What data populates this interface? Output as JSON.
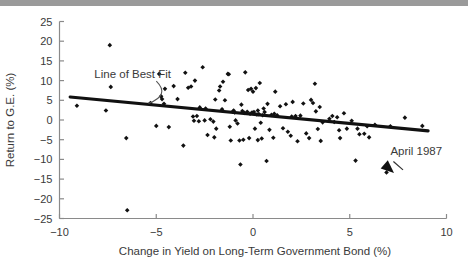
{
  "figure": {
    "top_band_color": "#9a9a9a",
    "background_color": "#ffffff",
    "axis_color": "#8a8a8a",
    "marker_color": "#111111",
    "fit_line_color": "#111111"
  },
  "chart_data": {
    "type": "scatter",
    "title": "",
    "xlabel": "Change in Yield on Long-Term Government Bond (%)",
    "ylabel": "Return to G.E. (%)",
    "xlim": [
      -10,
      10
    ],
    "ylim": [
      -25,
      25
    ],
    "xticks": [
      -10,
      -5,
      0,
      5,
      10
    ],
    "xticklabels": [
      "−10",
      "−5",
      "0",
      "5",
      "10"
    ],
    "yticks": [
      -25,
      -20,
      -15,
      -10,
      -5,
      0,
      5,
      10,
      15,
      20,
      25
    ],
    "yticklabels": [
      "−25",
      "−20",
      "−15",
      "−10",
      "−5",
      "0",
      "5",
      "10",
      "15",
      "20",
      "25"
    ],
    "grid": false,
    "legend": "none",
    "annotations": [
      {
        "name": "line-of-best-fit",
        "text": "Line of Best Fit",
        "text_x": -8.2,
        "text_y": 10.6,
        "points_to_x": -5.4,
        "points_to_y": 4.2
      },
      {
        "name": "april-1987",
        "text": "April 1987",
        "text_x": 7.1,
        "text_y": -9.0,
        "points_to_x": 6.9,
        "points_to_y": -13.3
      }
    ],
    "fit_line": {
      "label": "Line of Best Fit",
      "x": [
        -9.45,
        9.05
      ],
      "y": [
        5.85,
        -2.75
      ],
      "slope": -0.465,
      "intercept": 1.45
    },
    "series": [
      {
        "name": "G.E. monthly returns",
        "marker": "diamond",
        "points": [
          [
            -9.1,
            3.6
          ],
          [
            -7.4,
            19.0
          ],
          [
            -7.35,
            8.4
          ],
          [
            -7.6,
            2.4
          ],
          [
            -6.55,
            -4.6
          ],
          [
            -6.5,
            -22.9
          ],
          [
            -5.0,
            -1.5
          ],
          [
            -4.85,
            11.7
          ],
          [
            -4.75,
            6.0
          ],
          [
            -4.7,
            5.3
          ],
          [
            -4.6,
            4.1
          ],
          [
            -4.55,
            7.9
          ],
          [
            -4.35,
            -1.8
          ],
          [
            -4.1,
            8.6
          ],
          [
            -3.9,
            5.3
          ],
          [
            -3.6,
            -6.5
          ],
          [
            -3.5,
            12.0
          ],
          [
            -3.35,
            8.2
          ],
          [
            -3.2,
            8.5
          ],
          [
            -3.1,
            0.9
          ],
          [
            -3.05,
            -0.2
          ],
          [
            -3.0,
            10.0
          ],
          [
            -2.8,
            -0.3
          ],
          [
            -2.75,
            3.2
          ],
          [
            -2.6,
            13.4
          ],
          [
            -2.5,
            -0.1
          ],
          [
            -2.45,
            2.9
          ],
          [
            -2.35,
            -3.8
          ],
          [
            -2.2,
            0.2
          ],
          [
            -2.05,
            -0.4
          ],
          [
            -2.0,
            -4.4
          ],
          [
            -1.95,
            5.2
          ],
          [
            -1.9,
            -2.2
          ],
          [
            -1.75,
            7.5
          ],
          [
            -1.7,
            8.5
          ],
          [
            -1.6,
            2.7
          ],
          [
            -1.55,
            9.7
          ],
          [
            -1.45,
            5.0
          ],
          [
            -1.3,
            11.7
          ],
          [
            -1.25,
            11.6
          ],
          [
            -1.2,
            -1.7
          ],
          [
            -1.15,
            -5.2
          ],
          [
            -1.05,
            2.1
          ],
          [
            -0.95,
            1.9
          ],
          [
            -0.9,
            -0.1
          ],
          [
            -0.8,
            -0.9
          ],
          [
            -0.7,
            -5.2
          ],
          [
            -0.65,
            -11.3
          ],
          [
            -0.6,
            3.9
          ],
          [
            -0.5,
            -5.0
          ],
          [
            -0.45,
            1.8
          ],
          [
            -0.4,
            12.1
          ],
          [
            -0.3,
            2.1
          ],
          [
            -0.25,
            7.6
          ],
          [
            -0.2,
            -4.6
          ],
          [
            -0.15,
            1.6
          ],
          [
            -0.1,
            7.9
          ],
          [
            -0.05,
            1.9
          ],
          [
            0.0,
            7.2
          ],
          [
            0.05,
            2.0
          ],
          [
            0.1,
            -2.2
          ],
          [
            0.15,
            8.1
          ],
          [
            0.2,
            1.4
          ],
          [
            0.25,
            -5.1
          ],
          [
            0.3,
            1.5
          ],
          [
            0.35,
            9.4
          ],
          [
            0.4,
            -0.7
          ],
          [
            0.45,
            -4.7
          ],
          [
            0.5,
            1.2
          ],
          [
            0.55,
            2.9
          ],
          [
            0.7,
            -10.4
          ],
          [
            0.75,
            4.1
          ],
          [
            0.85,
            -2.5
          ],
          [
            0.95,
            1.3
          ],
          [
            1.05,
            -4.5
          ],
          [
            1.15,
            7.2
          ],
          [
            1.25,
            1.2
          ],
          [
            1.4,
            3.5
          ],
          [
            1.55,
            -2.1
          ],
          [
            1.7,
            4.0
          ],
          [
            1.8,
            -3.0
          ],
          [
            1.95,
            -4.0
          ],
          [
            2.05,
            4.6
          ],
          [
            2.2,
            1.0
          ],
          [
            2.3,
            -5.4
          ],
          [
            2.45,
            1.1
          ],
          [
            2.6,
            4.2
          ],
          [
            2.75,
            -3.4
          ],
          [
            2.9,
            -4.6
          ],
          [
            3.0,
            5.1
          ],
          [
            3.1,
            4.3
          ],
          [
            3.2,
            9.2
          ],
          [
            3.25,
            2.2
          ],
          [
            3.35,
            -2.3
          ],
          [
            3.45,
            3.3
          ],
          [
            3.5,
            -5.3
          ],
          [
            3.6,
            -0.6
          ],
          [
            3.95,
            0.3
          ],
          [
            4.1,
            1.0
          ],
          [
            4.2,
            -0.5
          ],
          [
            4.35,
            0.7
          ],
          [
            4.45,
            -2.6
          ],
          [
            4.5,
            -4.6
          ],
          [
            4.7,
            1.7
          ],
          [
            4.85,
            -2.2
          ],
          [
            5.1,
            -0.2
          ],
          [
            5.3,
            -10.3
          ],
          [
            5.4,
            -2.2
          ],
          [
            5.5,
            -3.6
          ],
          [
            5.75,
            -3.5
          ],
          [
            5.9,
            -1.6
          ],
          [
            6.0,
            -4.4
          ],
          [
            6.3,
            -1.2
          ],
          [
            6.9,
            -13.3
          ],
          [
            7.1,
            -1.6
          ],
          [
            7.85,
            0.6
          ],
          [
            8.75,
            -1.5
          ],
          [
            -5.3,
            4.3
          ],
          [
            -2.9,
            1.0
          ],
          [
            0.6,
            2.0
          ],
          [
            1.1,
            1.6
          ],
          [
            2.0,
            0.9
          ],
          [
            -1.0,
            2.4
          ],
          [
            -0.55,
            2.3
          ],
          [
            0.25,
            2.4
          ]
        ]
      }
    ]
  }
}
